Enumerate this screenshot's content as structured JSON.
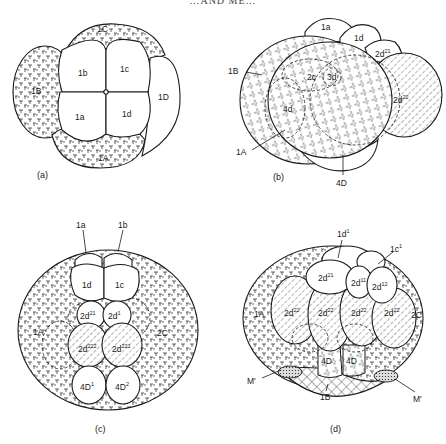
{
  "running_head": "…AND ME…",
  "figure": {
    "panels": [
      {
        "id": "a",
        "label": "(a)",
        "cells": {
          "micromeres": [
            "1a",
            "1b",
            "1c",
            "1d"
          ],
          "macromeres": [
            "1A",
            "1B",
            "1C",
            "1D"
          ]
        }
      },
      {
        "id": "b",
        "label": "(b)",
        "cells": {
          "top": [
            "1a",
            "1d",
            "2d21"
          ],
          "right_hatched": "2d22",
          "inner_dashed": [
            "2c",
            "3d",
            "4d"
          ],
          "pointers": [
            "1B",
            "1A",
            "4D"
          ]
        }
      },
      {
        "id": "c",
        "label": "(c)",
        "cells": {
          "pointers": [
            "1a",
            "1b"
          ],
          "micromeres": [
            "1d",
            "1c"
          ],
          "second_row": [
            "2d21",
            "2d1"
          ],
          "hatched": [
            "2d222",
            "2d221"
          ],
          "bottom": [
            "4D1",
            "4D2"
          ],
          "macromeres": [
            "1A",
            "2C"
          ]
        }
      },
      {
        "id": "d",
        "label": "(d)",
        "cells": {
          "pointers": [
            "1d1",
            "1c1",
            "M'",
            "M'",
            "1B"
          ],
          "top": [
            "2d21",
            "2d11",
            "2d12"
          ],
          "hatched": [
            "2d22",
            "2d22",
            "2d22",
            "2d22"
          ],
          "bottom": [
            "4D",
            "4D"
          ],
          "macromeres": [
            "1A",
            "2C"
          ]
        }
      }
    ],
    "labels": {
      "a_1C": "1C",
      "a_1B": "1B",
      "a_1A": "1A",
      "a_1D": "1D",
      "a_1a": "1a",
      "a_1b": "1b",
      "a_1c": "1c",
      "a_1d": "1d",
      "b_1a": "1a",
      "b_1d": "1d",
      "b_2d": "2d",
      "b_21": "21",
      "b_22": "22",
      "b_1B": "1B",
      "b_1A": "1A",
      "b_4D": "4D",
      "b_2c": "2c",
      "b_3d": "3d",
      "b_4d": "4d",
      "c_1a": "1a",
      "c_1b": "1b",
      "c_1d": "1d",
      "c_1c": "1c",
      "c_2d": "2d",
      "c_21": "21",
      "c_1": "1",
      "c_222": "222",
      "c_221": "221",
      "c_4D": "4D",
      "c_sup1": "1",
      "c_sup2": "2",
      "c_1A": "1A",
      "c_2C": "2C",
      "d_1d": "1d",
      "d_1c": "1c",
      "d_sup1": "1",
      "d_2d": "2d",
      "d_21": "21",
      "d_11": "11",
      "d_12": "12",
      "d_22": "22",
      "d_4D": "4D",
      "d_1A": "1A",
      "d_2C": "2C",
      "d_M": "M'",
      "d_1B": "1B"
    }
  }
}
